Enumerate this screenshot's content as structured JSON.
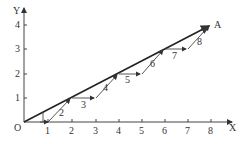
{
  "diagram": {
    "origin_label": "O",
    "x_axis_label": "X",
    "y_axis_label": "Y",
    "point_label": "A",
    "x_ticks": [
      "1",
      "2",
      "3",
      "4",
      "5",
      "6",
      "7",
      "8"
    ],
    "y_ticks": [
      "1",
      "2",
      "3",
      "4"
    ],
    "segment_labels": [
      "2",
      "3",
      "4",
      "5",
      "6",
      "7",
      "8"
    ],
    "colors": {
      "line": "#222222",
      "text": "#333333",
      "background": "#ffffff"
    }
  }
}
